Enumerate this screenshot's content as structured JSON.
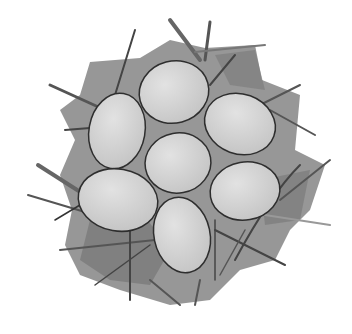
{
  "illustration": {
    "subject": "Bird nest with seven eggs, watercolor style, top-down view",
    "egg_count": 7,
    "colors": {
      "background": "#ffffff",
      "nest_fill": "#8a8a8a",
      "nest_dark": "#6e6e6e",
      "straw_light": "#b5b5b5",
      "straw_dark": "#4a4a4a",
      "egg_fill": "#cfcfcf",
      "egg_highlight": "#dedede",
      "egg_outline": "#2e2e2e"
    }
  }
}
